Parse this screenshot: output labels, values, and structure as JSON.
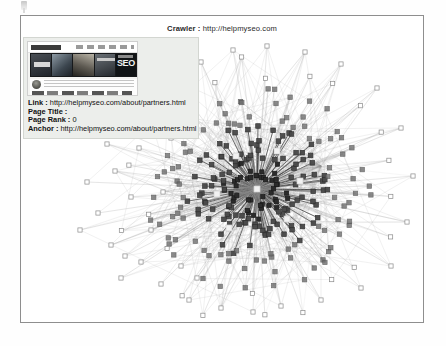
{
  "figure": {
    "title_label": "Crawler :",
    "title_url": "http://helpmyseo.com",
    "title_full": "Crawler : http://helpmyseo.com"
  },
  "info_panel": {
    "thumbnail": {
      "icon": "website-screenshot-thumbnail",
      "banner_text": "SEO",
      "avatar_icon": "user-avatar-icon"
    },
    "rows": [
      {
        "label": "Link :",
        "value": "http://helpmyseo.com/about/partners.html"
      },
      {
        "label": "Page Title :",
        "value": ""
      },
      {
        "label": "Page Rank :",
        "value": "0"
      },
      {
        "label": "Anchor :",
        "value": "http://helpmyseo.com/about/partners.html"
      }
    ]
  },
  "graph": {
    "type": "network-graph",
    "layout": "radial-hub-and-spoke",
    "center": {
      "x": 236,
      "y": 173
    },
    "node_shape": "square",
    "colors": {
      "frame_border": "#8e8e8e",
      "edge": "#9a9a9a",
      "node_core": "#2b2b2b",
      "node_mid": "#4a4a4a",
      "node_outer_fill": "#ffffff",
      "node_outer_stroke": "#8a8a8a",
      "highlight_node": "#f2f2f2",
      "panel_bg": "#eceeeb",
      "text": "#111111"
    },
    "highlight_nodes": [
      {
        "x": 236,
        "y": 173
      },
      {
        "x": 196,
        "y": 178
      },
      {
        "x": 279,
        "y": 165
      },
      {
        "x": 215,
        "y": 140
      },
      {
        "x": 256,
        "y": 135
      },
      {
        "x": 266,
        "y": 203
      },
      {
        "x": 208,
        "y": 212
      }
    ],
    "ring_counts": {
      "core": 7,
      "inner": 46,
      "middle": 110,
      "outer": 96,
      "sparse": 24
    }
  }
}
